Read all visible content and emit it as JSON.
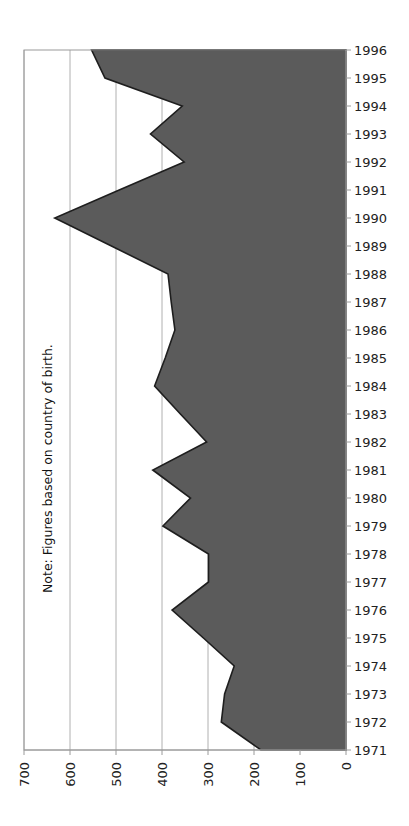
{
  "chart_data": {
    "type": "area",
    "orientation": "rotated-90-clockwise",
    "title": "",
    "xlabel": "",
    "ylabel": "",
    "annotation": "Note: Figures based on country of birth.",
    "categories": [
      "1971",
      "1972",
      "1973",
      "1974",
      "1975",
      "1976",
      "1977",
      "1978",
      "1979",
      "1980",
      "1981",
      "1982",
      "1983",
      "1984",
      "1985",
      "1986",
      "1987",
      "1988",
      "1989",
      "1990",
      "1991",
      "1992",
      "1993",
      "1994",
      "1995",
      "1996"
    ],
    "series": [
      {
        "name": "Immigrants",
        "values": [
          185,
          271,
          264,
          243,
          310,
          378,
          299,
          299,
          398,
          338,
          420,
          303,
          360,
          416,
          393,
          372,
          380,
          387,
          510,
          633,
          493,
          352,
          425,
          356,
          524,
          553
        ]
      }
    ],
    "value_ticks": [
      700,
      600,
      500,
      400,
      300,
      200,
      100,
      0
    ],
    "ylim": [
      0,
      700
    ],
    "grid": true,
    "legend": "none",
    "colors": {
      "fill": "#5b5b5b",
      "outline": "#1e1e1e",
      "grid": "#b0b0b0",
      "axis": "#9a9a9a"
    }
  }
}
